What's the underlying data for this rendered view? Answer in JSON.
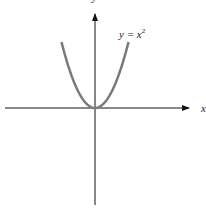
{
  "chart_data": {
    "type": "line",
    "title": "",
    "xlabel": "x",
    "ylabel": "y",
    "series": [
      {
        "name": "y = x^2",
        "x": [
          -1.0,
          -0.75,
          -0.5,
          -0.25,
          0,
          0.25,
          0.5,
          0.75,
          1.0
        ],
        "values": [
          1.0,
          0.5625,
          0.25,
          0.0625,
          0,
          0.0625,
          0.25,
          0.5625,
          1.0
        ]
      }
    ],
    "grid": false,
    "ticks": "none",
    "annotations": [
      "y = x²"
    ],
    "colors": {
      "curve": "#7a7a7a",
      "axes": "#111111"
    }
  },
  "labels": {
    "x_axis": "x",
    "y_axis": "y",
    "curve_base": "y = x",
    "curve_exp": "2"
  }
}
